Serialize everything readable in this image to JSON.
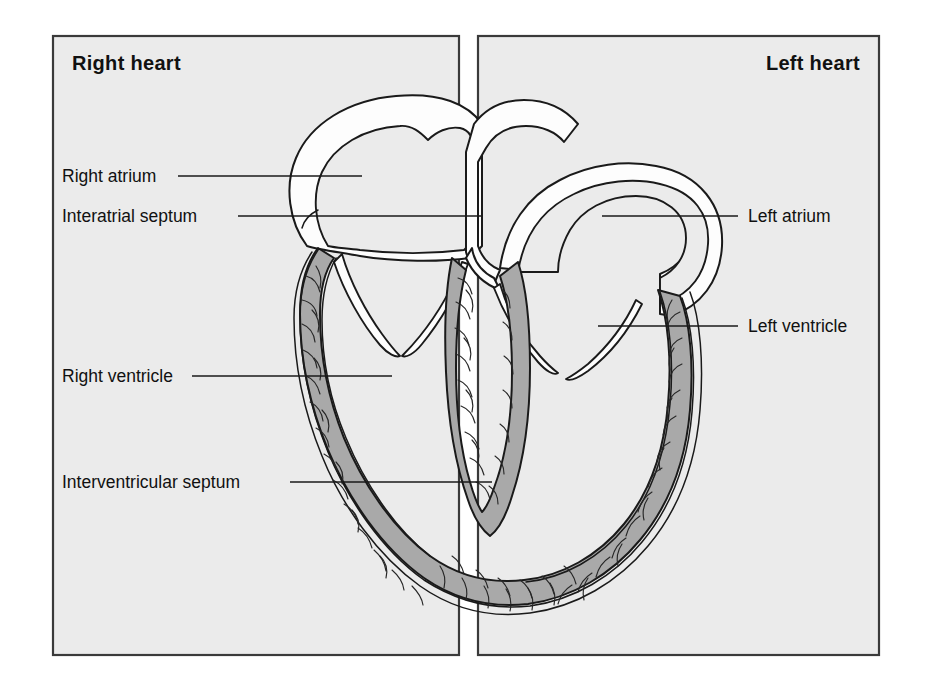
{
  "figure": {
    "type": "anatomical-diagram",
    "background_color": "#ffffff",
    "panel_fill": "#ebebeb",
    "panel_border_color": "#3a3a3a",
    "myocardium_color": "#a9a9a9",
    "outline_color": "#1a1a1a",
    "chamber_fill": "#ebebeb",
    "wall_fill": "#fdfdfd"
  },
  "panels": [
    {
      "id": "right-heart",
      "title": "Right heart",
      "title_align": "left",
      "x": 53,
      "y": 36,
      "width": 406,
      "height": 619
    },
    {
      "id": "left-heart",
      "title": "Left heart",
      "title_align": "right",
      "x": 478,
      "y": 36,
      "width": 401,
      "height": 619
    }
  ],
  "callouts": [
    {
      "id": "right-atrium",
      "label": "Right atrium",
      "side": "left",
      "text_x": 62,
      "text_y": 182,
      "line_x1": 178,
      "line_x2": 362,
      "line_y": 176
    },
    {
      "id": "interatrial-septum",
      "label": "Interatrial septum",
      "side": "left",
      "text_x": 62,
      "text_y": 222,
      "line_x1": 238,
      "line_x2": 482,
      "line_y": 216
    },
    {
      "id": "right-ventricle",
      "label": "Right ventricle",
      "side": "left",
      "text_x": 62,
      "text_y": 382,
      "line_x1": 192,
      "line_x2": 392,
      "line_y": 376
    },
    {
      "id": "interventricular-septum",
      "label": "Interventricular septum",
      "side": "left",
      "text_x": 62,
      "text_y": 488,
      "line_x1": 290,
      "line_x2": 492,
      "line_y": 482
    },
    {
      "id": "left-atrium",
      "label": "Left atrium",
      "side": "right",
      "text_x": 748,
      "text_y": 222,
      "line_x1": 602,
      "line_x2": 738,
      "line_y": 216
    },
    {
      "id": "left-ventricle",
      "label": "Left ventricle",
      "side": "right",
      "text_x": 748,
      "text_y": 332,
      "line_x1": 598,
      "line_x2": 738,
      "line_y": 326
    }
  ],
  "structures": [
    {
      "id": "right-atrium-chamber",
      "name": "Right atrium chamber"
    },
    {
      "id": "left-atrium-chamber",
      "name": "Left atrium chamber"
    },
    {
      "id": "interatrial-septum-wall",
      "name": "Interatrial septum"
    },
    {
      "id": "right-ventricle-cavity",
      "name": "Right ventricle cavity"
    },
    {
      "id": "left-ventricle-cavity",
      "name": "Left ventricle cavity"
    },
    {
      "id": "interventricular-septum-wall",
      "name": "Interventricular septum"
    },
    {
      "id": "tricuspid-valve",
      "name": "Tricuspid valve leaflets"
    },
    {
      "id": "mitral-valve",
      "name": "Mitral valve leaflets"
    },
    {
      "id": "myocardium",
      "name": "Ventricular myocardium"
    }
  ]
}
